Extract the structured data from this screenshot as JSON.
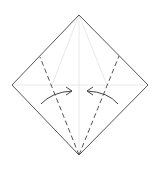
{
  "diagram": {
    "type": "origami-fold-step",
    "colors": {
      "outline": "#555555",
      "crease": "#dddddd",
      "valley_fold": "#555555",
      "arrow": "#444444"
    },
    "shape": {
      "top": [
        79,
        15
      ],
      "right": [
        148,
        85
      ],
      "bottom": [
        79,
        155
      ],
      "left": [
        12,
        85
      ]
    },
    "creases": [
      {
        "from": [
          12,
          85
        ],
        "to": [
          148,
          85
        ]
      },
      {
        "from": [
          79,
          15
        ],
        "to": [
          79,
          155
        ]
      },
      {
        "from": [
          79,
          15
        ],
        "to": [
          52,
          85
        ]
      },
      {
        "from": [
          79,
          15
        ],
        "to": [
          107,
          85
        ]
      }
    ],
    "valley_folds": [
      {
        "from": [
          79,
          155
        ],
        "to": [
          40,
          57
        ]
      },
      {
        "from": [
          79,
          155
        ],
        "to": [
          119,
          56
        ]
      }
    ],
    "arrows": [
      {
        "direction": "right",
        "label": "fold-left-flap-arrow"
      },
      {
        "direction": "left",
        "label": "fold-right-flap-arrow"
      }
    ]
  }
}
